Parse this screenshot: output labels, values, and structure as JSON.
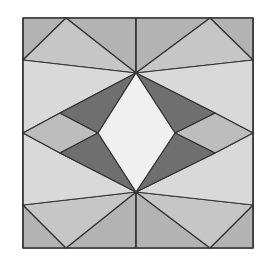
{
  "figure": {
    "colors": {
      "corner": "#b3b3b3",
      "outer_triangle": "#c6c6c6",
      "side_band": "#d9d9d9",
      "side_diamond": "#bdbdbd",
      "dark_wing": "#6f6f6f",
      "center_diamond": "#f0f0f0",
      "stroke": "#333333"
    },
    "frame": {
      "x": 23,
      "y": 18,
      "width": 230,
      "height": 230
    },
    "shapes": [
      {
        "name": "corner-top-left",
        "fill": "corner",
        "points": "23,18 66,18 23,60"
      },
      {
        "name": "corner-top-center-left",
        "fill": "corner",
        "points": "66,18 136,18 136,73"
      },
      {
        "name": "corner-top-center-right",
        "fill": "corner",
        "points": "136,18 210,18 136,73"
      },
      {
        "name": "corner-top-right",
        "fill": "corner",
        "points": "210,18 253,18 253,60"
      },
      {
        "name": "corner-bottom-left",
        "fill": "corner",
        "points": "23,205 23,248 66,248"
      },
      {
        "name": "corner-bottom-center-left",
        "fill": "corner",
        "points": "66,248 136,248 136,192"
      },
      {
        "name": "corner-bottom-center-right",
        "fill": "corner",
        "points": "136,248 210,248 136,192"
      },
      {
        "name": "corner-bottom-right",
        "fill": "corner",
        "points": "253,205 253,248 210,248"
      },
      {
        "name": "outer-triangle-top-left",
        "fill": "outer_triangle",
        "points": "66,18 23,60 136,73"
      },
      {
        "name": "outer-triangle-top-right",
        "fill": "outer_triangle",
        "points": "210,18 253,60 136,73"
      },
      {
        "name": "outer-triangle-bottom-left",
        "fill": "outer_triangle",
        "points": "23,205 66,248 136,192"
      },
      {
        "name": "outer-triangle-bottom-right",
        "fill": "outer_triangle",
        "points": "253,205 210,248 136,192"
      },
      {
        "name": "side-band-upper-left",
        "fill": "side_band",
        "points": "23,60 136,73 60,113 23,133"
      },
      {
        "name": "side-band-lower-left",
        "fill": "side_band",
        "points": "23,133 60,153 136,192 23,205"
      },
      {
        "name": "side-band-upper-right",
        "fill": "side_band",
        "points": "253,60 136,73 215,113 253,133"
      },
      {
        "name": "side-band-lower-right",
        "fill": "side_band",
        "points": "253,133 215,153 136,192 253,205"
      },
      {
        "name": "side-diamond-left",
        "fill": "side_diamond",
        "points": "23,133 60,113 98,133 60,153"
      },
      {
        "name": "side-diamond-right",
        "fill": "side_diamond",
        "points": "253,133 215,113 175,133 215,153"
      },
      {
        "name": "dark-wing-upper-left",
        "fill": "dark_wing",
        "points": "136,73 60,113 98,133"
      },
      {
        "name": "dark-wing-lower-left",
        "fill": "dark_wing",
        "points": "98,133 60,153 136,192"
      },
      {
        "name": "dark-wing-upper-right",
        "fill": "dark_wing",
        "points": "136,73 215,113 175,133"
      },
      {
        "name": "dark-wing-lower-right",
        "fill": "dark_wing",
        "points": "175,133 215,153 136,192"
      },
      {
        "name": "center-diamond",
        "fill": "center_diamond",
        "points": "136,73 175,133 136,192 98,133"
      }
    ],
    "lines": [
      {
        "name": "top-center-line",
        "x1": 136,
        "y1": 18,
        "x2": 136,
        "y2": 73
      },
      {
        "name": "bottom-center-line",
        "x1": 136,
        "y1": 192,
        "x2": 136,
        "y2": 248
      }
    ]
  }
}
